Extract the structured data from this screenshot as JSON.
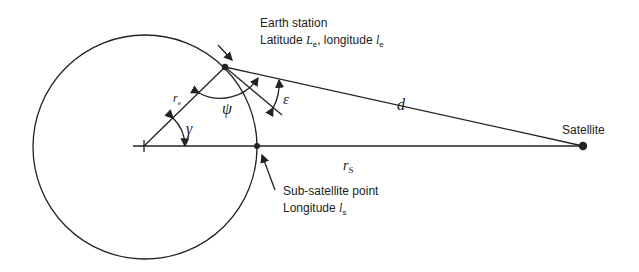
{
  "labels": {
    "earth_station_title": "Earth station",
    "earth_station_coords_prefix": "Latitude ",
    "earth_station_lat_symbol": "L",
    "earth_station_lat_sub": "e",
    "earth_station_coords_mid": ", longitude ",
    "earth_station_lon_symbol": "l",
    "earth_station_lon_sub": "e",
    "sub_satellite_title": "Sub-satellite point",
    "sub_satellite_lon_prefix": "Longitude ",
    "sub_satellite_lon_symbol": "l",
    "sub_satellite_lon_sub": "s",
    "satellite": "Satellite"
  },
  "symbols": {
    "earth_radius": "r",
    "earth_radius_sub": "e",
    "satellite_radius": "r",
    "satellite_radius_sub": "S",
    "range": "d",
    "central_angle": "γ",
    "psi": "ψ",
    "elevation": "ε"
  },
  "colors": {
    "ink": "#222222",
    "background": "#ffffff"
  }
}
